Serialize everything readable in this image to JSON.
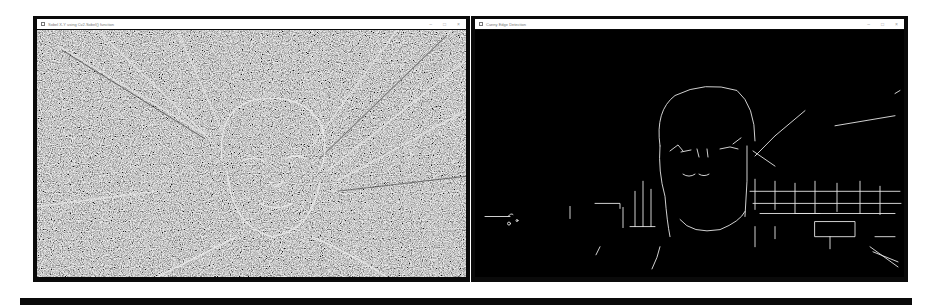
{
  "windows": [
    {
      "title": "Sobel X-Y using Cv2.Sobel() function",
      "controls": {
        "minimize": "–",
        "maximize": "□",
        "close": "×"
      },
      "content": {
        "type": "sobel-gradient-image",
        "background": "#8a8a8a"
      }
    },
    {
      "title": "Canny Edge Detection",
      "controls": {
        "minimize": "–",
        "maximize": "□",
        "close": "×"
      },
      "content": {
        "type": "canny-edge-image",
        "background": "#000000",
        "edge_color": "#e6e6e6"
      }
    }
  ],
  "colors": {
    "frame": "#0a0a0a",
    "titlebar": "#ffffff",
    "page": "#ffffff"
  }
}
